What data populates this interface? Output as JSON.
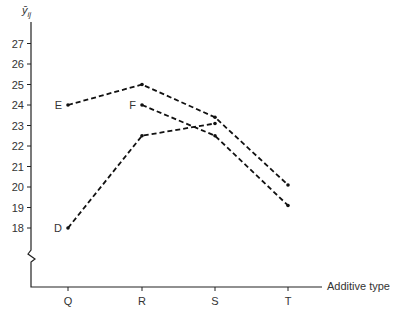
{
  "chart_data": {
    "type": "line",
    "title": "",
    "ylabel": "ȳ_ij",
    "xlabel": "Additive type",
    "categories": [
      "Q",
      "R",
      "S",
      "T"
    ],
    "y_ticks": [
      18,
      19,
      20,
      21,
      22,
      23,
      24,
      25,
      26,
      27
    ],
    "ylim": [
      18,
      27
    ],
    "y_axis_break": true,
    "grid": false,
    "legend": "inline labels at series start",
    "series": [
      {
        "name": "D",
        "values": [
          18.0,
          22.5,
          23.1,
          null
        ]
      },
      {
        "name": "E",
        "values": [
          24.0,
          25.0,
          23.4,
          20.1
        ]
      },
      {
        "name": "F",
        "values": [
          null,
          24.0,
          22.5,
          19.1
        ]
      }
    ],
    "line_style": "dashed",
    "line_color": "#111111"
  },
  "labels": {
    "y_axis_symbol": "ȳ",
    "y_axis_subscript": "ij",
    "x_axis_title": "Additive type"
  }
}
